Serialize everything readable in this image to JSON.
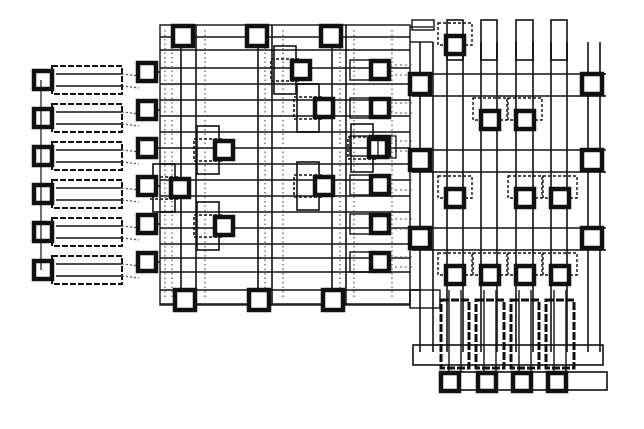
{
  "diagram": {
    "type": "ic-layout-pla",
    "width": 644,
    "height": 429,
    "colors": {
      "ink": "#111111",
      "paper": "#ffffff",
      "faint": "#555555"
    },
    "left_inputs": {
      "rows_y": [
        80,
        118,
        156,
        194,
        232,
        270
      ],
      "pad_x": 43,
      "transistor": {
        "x": 52,
        "w": 70,
        "h": 28
      },
      "contact_x": 147
    },
    "and_plane": {
      "x0": 160,
      "x1": 410,
      "y0": 25,
      "y1": 305,
      "verticals_x": [
        181,
        196,
        258,
        272,
        332,
        346
      ],
      "dotted_verticals_x": [
        165,
        172,
        205,
        265,
        283,
        340,
        354,
        392
      ],
      "horizontals_y": [
        37,
        50,
        68,
        84,
        100,
        116,
        132,
        148,
        164,
        180,
        196,
        212,
        228,
        244,
        258,
        272,
        290,
        304
      ],
      "top_contacts_x": [
        183,
        257,
        331
      ],
      "bottom_contacts_x": [
        185,
        259,
        333
      ],
      "right_contacts": [
        [
          380,
          70
        ],
        [
          380,
          108
        ],
        [
          380,
          146
        ],
        [
          380,
          185
        ],
        [
          380,
          224
        ],
        [
          380,
          262
        ]
      ],
      "crosses": [
        [
          285,
          70
        ],
        [
          308,
          108
        ],
        [
          208,
          150
        ],
        [
          362,
          148
        ],
        [
          164,
          188
        ],
        [
          308,
          186
        ],
        [
          208,
          226
        ]
      ]
    },
    "or_plane": {
      "x0": 412,
      "x1": 606,
      "y0": 20,
      "y1": 390,
      "verticals_x": [
        420,
        433,
        447,
        463,
        481,
        497,
        516,
        533,
        551,
        567,
        588,
        600
      ],
      "columns_top": [
        [
          447,
          463
        ],
        [
          481,
          497
        ],
        [
          516,
          533
        ],
        [
          551,
          567
        ]
      ],
      "side_contacts": [
        [
          420,
          84
        ],
        [
          592,
          84
        ],
        [
          420,
          160
        ],
        [
          592,
          160
        ],
        [
          420,
          238
        ],
        [
          592,
          238
        ]
      ],
      "inner_contacts": [
        [
          455,
          45
        ],
        [
          490,
          120
        ],
        [
          525,
          120
        ],
        [
          455,
          198
        ],
        [
          525,
          198
        ],
        [
          560,
          198
        ],
        [
          455,
          275
        ],
        [
          490,
          275
        ],
        [
          525,
          275
        ],
        [
          560,
          275
        ]
      ],
      "output_transistors_x": [
        455,
        490,
        525,
        560
      ],
      "bottom_contacts_x": [
        450,
        487,
        522,
        557
      ]
    }
  }
}
